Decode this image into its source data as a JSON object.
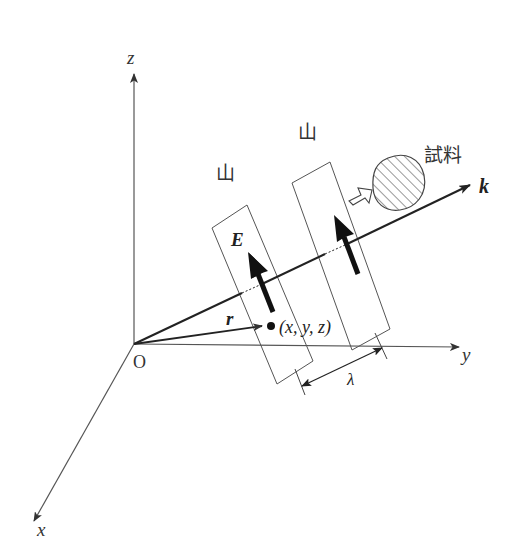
{
  "diagram": {
    "colors": {
      "ink": "#2a2a2a",
      "axis": "#555555",
      "background": "#ffffff"
    },
    "axes": {
      "origin_label": "O",
      "x_label": "x",
      "y_label": "y",
      "z_label": "z"
    },
    "wave": {
      "wavevector_label": "k",
      "field_label": "E",
      "position_vector_label": "r",
      "point_label": "(x, y, z)",
      "wavelength_label": "λ",
      "crest_labels": [
        "山",
        "山"
      ]
    },
    "sample": {
      "label": "試料"
    }
  }
}
